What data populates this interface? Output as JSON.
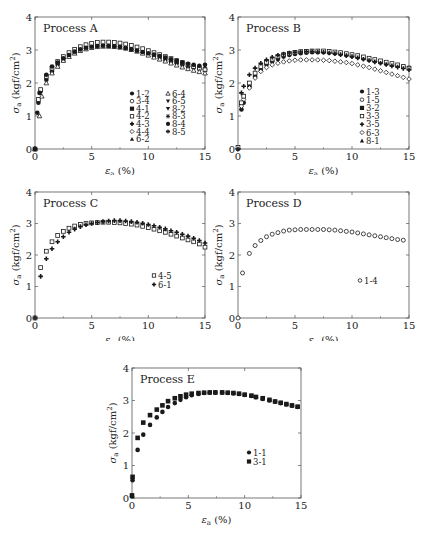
{
  "figure": {
    "x_axis_label": "εa (%)",
    "y_axis_label": "σa (kgf/cm²)",
    "x_ticks": [
      "0",
      "5",
      "10",
      "15"
    ],
    "y_ticks": [
      "0",
      "1",
      "2",
      "3",
      "4"
    ],
    "colors": {
      "frame": "#555555",
      "marker": "#1a1a1a",
      "background": "#ffffff"
    }
  },
  "chart_data": [
    {
      "type": "scatter",
      "title": "Process A",
      "xlabel": "εa (%)",
      "ylabel": "σa (kgf/cm²)",
      "xlim": [
        0,
        15
      ],
      "ylim": [
        0,
        4
      ],
      "grid": false,
      "legend_position": "lower-right, two columns",
      "legend": [
        "1-2",
        "3-4",
        "4-1",
        "4-2",
        "4-3",
        "4-4",
        "6-2",
        "6-4",
        "6-5",
        "8-2",
        "8-3",
        "8-4",
        "8-5"
      ],
      "markers": [
        "circle-filled",
        "circle-open",
        "square-filled",
        "square-open",
        "plus-filled",
        "diamond-open",
        "triangle-filled",
        "triangle-open",
        "triangle-down-filled",
        "triangle-down-filled",
        "star",
        "circle-filled",
        "star"
      ],
      "series": [
        {
          "name": "1-2",
          "x": [
            0,
            0.3,
            0.5,
            1,
            1.5,
            2,
            2.5,
            3,
            3.5,
            4,
            4.5,
            5,
            5.5,
            6,
            6.5,
            7,
            7.5,
            8,
            8.5,
            9,
            9.5,
            10,
            10.5,
            11,
            11.5,
            12,
            12.5,
            13,
            13.5,
            14,
            14.5,
            15
          ],
          "y": [
            0,
            1.4,
            1.75,
            2.1,
            2.35,
            2.55,
            2.7,
            2.82,
            2.92,
            3.0,
            3.05,
            3.1,
            3.12,
            3.13,
            3.13,
            3.12,
            3.1,
            3.07,
            3.03,
            2.98,
            2.93,
            2.88,
            2.82,
            2.76,
            2.7,
            2.65,
            2.6,
            2.55,
            2.5,
            2.47,
            2.44,
            2.42
          ]
        },
        {
          "name": "4-2",
          "x": [
            0,
            0.3,
            0.5,
            1,
            1.5,
            2,
            2.5,
            3,
            3.5,
            4,
            4.5,
            5,
            5.5,
            6,
            6.5,
            7,
            7.5,
            8,
            8.5,
            9,
            9.5,
            10,
            10.5,
            11,
            11.5,
            12,
            12.5,
            13,
            13.5,
            14,
            14.5,
            15
          ],
          "y": [
            0,
            1.5,
            1.8,
            2.2,
            2.45,
            2.65,
            2.8,
            2.92,
            3.02,
            3.1,
            3.16,
            3.2,
            3.23,
            3.24,
            3.24,
            3.23,
            3.21,
            3.18,
            3.14,
            3.09,
            3.04,
            2.98,
            2.92,
            2.86,
            2.8,
            2.74,
            2.68,
            2.62,
            2.56,
            2.5,
            2.45,
            2.4
          ]
        },
        {
          "name": "6-4",
          "x": [
            0,
            0.4,
            0.6,
            1,
            1.5,
            2,
            2.5,
            3,
            3.5,
            4,
            4.5,
            5,
            5.5,
            6,
            6.5,
            7,
            7.5,
            8,
            8.5,
            9,
            9.5,
            10,
            10.5,
            11,
            11.5,
            12,
            12.5,
            13,
            13.5,
            14,
            14.5,
            15
          ],
          "y": [
            0,
            1.0,
            1.6,
            2.0,
            2.3,
            2.5,
            2.68,
            2.8,
            2.9,
            2.98,
            3.03,
            3.07,
            3.1,
            3.11,
            3.11,
            3.1,
            3.08,
            3.05,
            3.01,
            2.96,
            2.9,
            2.84,
            2.78,
            2.72,
            2.66,
            2.6,
            2.54,
            2.48,
            2.43,
            2.38,
            2.34,
            2.3
          ]
        },
        {
          "name": "8-4",
          "x": [
            0,
            0.2,
            0.4,
            1,
            1.5,
            2,
            2.5,
            3,
            3.5,
            4,
            4.5,
            5,
            5.5,
            6,
            6.5,
            7,
            7.5,
            8,
            8.5,
            9,
            9.5,
            10,
            10.5,
            11,
            11.5,
            12,
            12.5,
            13,
            13.5,
            14,
            14.5,
            15
          ],
          "y": [
            0,
            1.1,
            1.7,
            2.25,
            2.5,
            2.62,
            2.75,
            2.85,
            2.95,
            3.02,
            3.07,
            3.1,
            3.12,
            3.13,
            3.12,
            3.11,
            3.09,
            3.06,
            3.02,
            2.98,
            2.94,
            2.9,
            2.86,
            2.82,
            2.77,
            2.72,
            2.67,
            2.62,
            2.58,
            2.55,
            2.52,
            2.55
          ]
        }
      ]
    },
    {
      "type": "scatter",
      "title": "Process B",
      "xlabel": "εa (%)",
      "ylabel": "σa (kgf/cm²)",
      "xlim": [
        0,
        15
      ],
      "ylim": [
        0,
        4
      ],
      "grid": false,
      "legend_position": "lower-right",
      "legend": [
        "1-3",
        "1-5",
        "3-2",
        "3-3",
        "3-5",
        "6-3",
        "8-1"
      ],
      "markers": [
        "circle-filled",
        "circle-open",
        "square-filled",
        "square-open",
        "plus-filled",
        "diamond-open",
        "triangle-filled"
      ],
      "series": [
        {
          "name": "1-3",
          "x": [
            0,
            0.3,
            0.5,
            1,
            1.5,
            2,
            2.5,
            3,
            3.5,
            4,
            4.5,
            5,
            5.5,
            6,
            6.5,
            7,
            7.5,
            8,
            8.5,
            9,
            9.5,
            10,
            10.5,
            11,
            11.5,
            12,
            12.5,
            13,
            13.5,
            14,
            14.5,
            15
          ],
          "y": [
            0,
            1.2,
            1.4,
            1.9,
            2.2,
            2.4,
            2.55,
            2.65,
            2.73,
            2.8,
            2.85,
            2.88,
            2.9,
            2.92,
            2.93,
            2.93,
            2.93,
            2.92,
            2.9,
            2.88,
            2.85,
            2.82,
            2.78,
            2.74,
            2.7,
            2.66,
            2.62,
            2.58,
            2.55,
            2.52,
            2.49,
            2.46
          ]
        },
        {
          "name": "6-3",
          "x": [
            0,
            0.3,
            0.5,
            1,
            1.5,
            2,
            2.5,
            3,
            3.5,
            4,
            4.5,
            5,
            5.5,
            6,
            6.5,
            7,
            7.5,
            8,
            8.5,
            9,
            9.5,
            10,
            10.5,
            11,
            11.5,
            12,
            12.5,
            13,
            13.5,
            14,
            14.5,
            15
          ],
          "y": [
            0,
            1.3,
            1.5,
            1.85,
            2.15,
            2.35,
            2.47,
            2.55,
            2.6,
            2.64,
            2.67,
            2.69,
            2.7,
            2.7,
            2.7,
            2.7,
            2.69,
            2.68,
            2.66,
            2.64,
            2.62,
            2.59,
            2.55,
            2.51,
            2.47,
            2.42,
            2.37,
            2.32,
            2.27,
            2.22,
            2.17,
            2.12
          ]
        },
        {
          "name": "3-3",
          "x": [
            0,
            0.3,
            0.5,
            1,
            1.5,
            2,
            2.5,
            3,
            3.5,
            4,
            4.5,
            5,
            5.5,
            6,
            6.5,
            7,
            7.5,
            8,
            8.5,
            9,
            9.5,
            10,
            10.5,
            11,
            11.5,
            12,
            12.5,
            13,
            13.5,
            14,
            14.5,
            15
          ],
          "y": [
            0.05,
            1.4,
            1.6,
            2.0,
            2.3,
            2.5,
            2.63,
            2.72,
            2.8,
            2.86,
            2.9,
            2.93,
            2.95,
            2.96,
            2.97,
            2.97,
            2.97,
            2.96,
            2.94,
            2.92,
            2.89,
            2.86,
            2.83,
            2.79,
            2.75,
            2.71,
            2.67,
            2.63,
            2.59,
            2.55,
            2.5,
            2.45
          ]
        },
        {
          "name": "3-5",
          "x": [
            0,
            0.3,
            0.5,
            1,
            1.5,
            2,
            2.5,
            3,
            3.5,
            4,
            4.5,
            5,
            5.5,
            6,
            6.5,
            7,
            7.5,
            8,
            8.5,
            9,
            9.5,
            10,
            10.5,
            11,
            11.5,
            12,
            12.5,
            13,
            13.5,
            14,
            14.5,
            15
          ],
          "y": [
            0,
            1.7,
            1.9,
            2.25,
            2.45,
            2.6,
            2.7,
            2.78,
            2.84,
            2.88,
            2.91,
            2.93,
            2.94,
            2.95,
            2.95,
            2.94,
            2.93,
            2.91,
            2.89,
            2.86,
            2.83,
            2.8,
            2.76,
            2.72,
            2.68,
            2.64,
            2.6,
            2.56,
            2.52,
            2.48,
            2.44,
            2.4
          ]
        }
      ]
    },
    {
      "type": "scatter",
      "title": "Process C",
      "xlabel": "εa (%)",
      "ylabel": "σa (kgf/cm²)",
      "xlim": [
        0,
        15
      ],
      "ylim": [
        0,
        4
      ],
      "grid": false,
      "legend_position": "lower-right",
      "legend": [
        "4-5",
        "6-1"
      ],
      "markers": [
        "square-open",
        "plus-filled"
      ],
      "series": [
        {
          "name": "4-5",
          "x": [
            0,
            0.5,
            1,
            1.5,
            2,
            2.5,
            3,
            3.5,
            4,
            4.5,
            5,
            5.5,
            6,
            6.5,
            7,
            7.5,
            8,
            8.5,
            9,
            9.5,
            10,
            10.5,
            11,
            11.5,
            12,
            12.5,
            13,
            13.5,
            14,
            14.5,
            15
          ],
          "y": [
            0,
            1.6,
            2.12,
            2.42,
            2.62,
            2.75,
            2.85,
            2.92,
            2.97,
            3.0,
            3.02,
            3.03,
            3.04,
            3.04,
            3.03,
            3.02,
            3.0,
            2.98,
            2.95,
            2.91,
            2.87,
            2.82,
            2.77,
            2.72,
            2.66,
            2.6,
            2.54,
            2.48,
            2.42,
            2.35,
            2.25
          ]
        },
        {
          "name": "6-1",
          "x": [
            0,
            0.5,
            1,
            1.5,
            2,
            2.5,
            3,
            3.5,
            4,
            4.5,
            5,
            5.5,
            6,
            6.5,
            7,
            7.5,
            8,
            8.5,
            9,
            9.5,
            10,
            10.5,
            11,
            11.5,
            12,
            12.5,
            13,
            13.5,
            14,
            14.5,
            15
          ],
          "y": [
            0,
            1.32,
            1.88,
            2.2,
            2.42,
            2.58,
            2.72,
            2.82,
            2.9,
            2.96,
            3.0,
            3.03,
            3.06,
            3.08,
            3.09,
            3.09,
            3.08,
            3.06,
            3.04,
            3.01,
            2.97,
            2.93,
            2.88,
            2.83,
            2.77,
            2.72,
            2.66,
            2.6,
            2.53,
            2.46,
            2.38
          ]
        }
      ]
    },
    {
      "type": "scatter",
      "title": "Process D",
      "xlabel": "εa (%)",
      "ylabel": "σa (kgf/cm²)",
      "xlim": [
        0,
        15
      ],
      "ylim": [
        0,
        4
      ],
      "grid": false,
      "legend_position": "lower-right",
      "legend": [
        "1-4"
      ],
      "markers": [
        "circle-open"
      ],
      "series": [
        {
          "name": "1-4",
          "x": [
            0,
            0.4,
            1,
            1.5,
            2,
            2.5,
            3,
            3.5,
            4,
            4.5,
            5,
            5.5,
            6,
            6.5,
            7,
            7.5,
            8,
            8.5,
            9,
            9.5,
            10,
            10.5,
            11,
            11.5,
            12,
            12.5,
            13,
            13.5,
            14,
            14.5
          ],
          "y": [
            0,
            1.43,
            2.05,
            2.3,
            2.46,
            2.58,
            2.66,
            2.71,
            2.76,
            2.79,
            2.8,
            2.81,
            2.81,
            2.81,
            2.81,
            2.81,
            2.8,
            2.79,
            2.77,
            2.75,
            2.73,
            2.7,
            2.67,
            2.64,
            2.61,
            2.58,
            2.55,
            2.52,
            2.49,
            2.47
          ]
        }
      ]
    },
    {
      "type": "scatter",
      "title": "Process E",
      "xlabel": "εa (%)",
      "ylabel": "σa (kgf/cm²)",
      "xlim": [
        0,
        15
      ],
      "ylim": [
        0,
        4
      ],
      "grid": false,
      "legend_position": "lower-right",
      "legend": [
        "1-1",
        "3-1"
      ],
      "markers": [
        "circle-filled",
        "square-filled"
      ],
      "series": [
        {
          "name": "1-1",
          "x": [
            0,
            0.05,
            0.5,
            1,
            1.6,
            2.2,
            2.7,
            3.2,
            3.8,
            4.3,
            4.8,
            5.3,
            5.9,
            6.4,
            6.9,
            7.4,
            8,
            8.5,
            9,
            9.5,
            10,
            10.6,
            11,
            11.6,
            12.2,
            12.7,
            13.2,
            13.7,
            14.2,
            14.7
          ],
          "y": [
            0.05,
            0.55,
            1.48,
            1.95,
            2.25,
            2.48,
            2.65,
            2.8,
            2.92,
            3.02,
            3.1,
            3.16,
            3.2,
            3.23,
            3.24,
            3.24,
            3.24,
            3.23,
            3.22,
            3.2,
            3.17,
            3.14,
            3.1,
            3.05,
            3.0,
            2.96,
            2.92,
            2.88,
            2.84,
            2.8
          ]
        },
        {
          "name": "3-1",
          "x": [
            0,
            0.05,
            0.5,
            1,
            1.6,
            2.2,
            2.7,
            3.2,
            3.8,
            4.3,
            4.8,
            5.3,
            5.9,
            6.4,
            6.9,
            7.4,
            8,
            8.5,
            9,
            9.5,
            10,
            10.6,
            11,
            11.6,
            12.2,
            12.7,
            13.2,
            13.7,
            14.2,
            14.7
          ],
          "y": [
            0.08,
            0.65,
            1.85,
            2.32,
            2.55,
            2.72,
            2.85,
            2.98,
            3.07,
            3.13,
            3.18,
            3.21,
            3.23,
            3.24,
            3.25,
            3.25,
            3.25,
            3.24,
            3.23,
            3.21,
            3.18,
            3.15,
            3.11,
            3.07,
            3.02,
            2.97,
            2.93,
            2.89,
            2.85,
            2.81
          ]
        }
      ]
    }
  ]
}
